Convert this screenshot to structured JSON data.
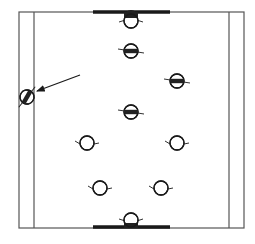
{
  "diagram": {
    "type": "court-formation-top-view",
    "canvas": {
      "width": 255,
      "height": 244,
      "background": "#ffffff"
    },
    "colors": {
      "line": "#555555",
      "ink": "#1a1a1a",
      "fill_dark": "#222222"
    },
    "court": {
      "outer": {
        "x1": 19,
        "y1": 12,
        "x2": 244,
        "y2": 228
      },
      "inner_left_x": 34,
      "inner_right_x": 229,
      "top_bar": {
        "x1": 93,
        "x2": 170,
        "y": 12
      },
      "bottom_bar": {
        "x1": 93,
        "x2": 170,
        "y": 227
      }
    },
    "figures": [
      {
        "id": "top-goal-figure",
        "cx": 131,
        "cy": 21,
        "style": "half-filled-top",
        "facing": "down"
      },
      {
        "id": "figure-row2-center",
        "cx": 131,
        "cy": 51,
        "style": "band"
      },
      {
        "id": "figure-row3-right",
        "cx": 177,
        "cy": 81,
        "style": "band"
      },
      {
        "id": "figure-row4-center",
        "cx": 131,
        "cy": 112,
        "style": "band"
      },
      {
        "id": "figure-row5-left",
        "cx": 87,
        "cy": 143,
        "style": "open"
      },
      {
        "id": "figure-row5-right",
        "cx": 177,
        "cy": 143,
        "style": "open"
      },
      {
        "id": "figure-row6-left",
        "cx": 100,
        "cy": 188,
        "style": "open"
      },
      {
        "id": "figure-row6-right",
        "cx": 161,
        "cy": 188,
        "style": "open"
      },
      {
        "id": "bottom-goal-figure",
        "cx": 131,
        "cy": 220,
        "style": "half-filled-bottom",
        "facing": "up"
      },
      {
        "id": "side-figure-tilted",
        "cx": 27,
        "cy": 97,
        "style": "band-tilted",
        "rotation": -60
      }
    ],
    "arrow": {
      "x1": 80,
      "y1": 75,
      "x2": 37,
      "y2": 91,
      "points_to": "side-figure-tilted"
    }
  }
}
